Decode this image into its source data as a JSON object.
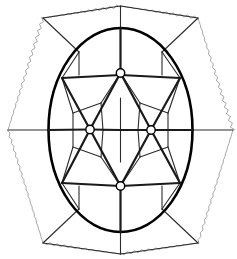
{
  "figure": {
    "type": "line-diagram",
    "canvas": {
      "width": 237,
      "height": 259,
      "background": "#ffffff"
    },
    "colors": {
      "ellipse_stroke": "#000000",
      "heavy_edge": "#1a1a1a",
      "light_edge": "#2b2b2b",
      "wavy_border": "#a8a8a8",
      "node_fill": "#ffffff",
      "node_stroke": "#000000"
    },
    "stroke_widths": {
      "ellipse": 2.6,
      "heavy_edge": 2.2,
      "light_edge": 1.1,
      "wavy_border": 1.0,
      "node": 1.4
    },
    "ellipse": {
      "label": "outer-ellipse",
      "cx": 120.5,
      "cy": 130,
      "rx": 72,
      "ry": 102
    },
    "wavy_border": {
      "label": "wavy-hexagon-border",
      "amplitude": 1.6,
      "wavelength": 7,
      "vertices": [
        [
          120.5,
          6
        ],
        [
          198,
          18
        ],
        [
          233,
          130
        ],
        [
          198,
          243
        ],
        [
          120.5,
          254
        ],
        [
          43,
          243
        ],
        [
          8,
          130
        ],
        [
          43,
          18
        ]
      ]
    },
    "nodes": [
      {
        "name": "node-top-center",
        "x": 120.5,
        "y": 73,
        "r": 4.2
      },
      {
        "name": "node-mid-left",
        "x": 90,
        "y": 129.5,
        "r": 4.2
      },
      {
        "name": "node-mid-right",
        "x": 151,
        "y": 130,
        "r": 4.2
      },
      {
        "name": "node-bottom-center",
        "x": 120.5,
        "y": 186,
        "r": 4.2
      }
    ],
    "heavy_edges": [
      {
        "name": "edge-vertical-axis-top",
        "x1": 120.5,
        "y1": 28,
        "x2": 120.5,
        "y2": 73
      },
      {
        "name": "edge-vertical-axis-bottom",
        "x1": 120.5,
        "y1": 186,
        "x2": 120.5,
        "y2": 232
      },
      {
        "name": "edge-horiz-left-band",
        "x1": 62,
        "y1": 78,
        "x2": 120.5,
        "y2": 75
      },
      {
        "name": "edge-horiz-right-band",
        "x1": 120.5,
        "y1": 75,
        "x2": 180,
        "y2": 78
      },
      {
        "name": "edge-horiz-left-band-low",
        "x1": 62,
        "y1": 183,
        "x2": 120.5,
        "y2": 186
      },
      {
        "name": "edge-horiz-right-band-low",
        "x1": 120.5,
        "y1": 186,
        "x2": 180,
        "y2": 183
      },
      {
        "name": "edge-top-to-midleft",
        "x1": 120.5,
        "y1": 73,
        "x2": 90,
        "y2": 129.5
      },
      {
        "name": "edge-top-to-midright",
        "x1": 120.5,
        "y1": 73,
        "x2": 151,
        "y2": 130
      },
      {
        "name": "edge-midleft-to-bottom",
        "x1": 90,
        "y1": 129.5,
        "x2": 120.5,
        "y2": 186
      },
      {
        "name": "edge-midright-to-bottom",
        "x1": 151,
        "y1": 130,
        "x2": 120.5,
        "y2": 186
      },
      {
        "name": "edge-midleft-to-upperleft-rim",
        "x1": 90,
        "y1": 129.5,
        "x2": 62,
        "y2": 78
      },
      {
        "name": "edge-midright-to-upperright-rim",
        "x1": 151,
        "y1": 130,
        "x2": 180,
        "y2": 78
      },
      {
        "name": "edge-midleft-to-lowerleft-rim",
        "x1": 90,
        "y1": 129.5,
        "x2": 62,
        "y2": 183
      },
      {
        "name": "edge-midright-to-lowerright-rim",
        "x1": 151,
        "y1": 130,
        "x2": 180,
        "y2": 183
      },
      {
        "name": "edge-midleft-to-center-horiz",
        "x1": 90,
        "y1": 129.5,
        "x2": 120.5,
        "y2": 130
      },
      {
        "name": "edge-center-to-midright-horiz",
        "x1": 120.5,
        "y1": 130,
        "x2": 151,
        "y2": 130
      },
      {
        "name": "edge-left-rim-horizontal",
        "x1": 48,
        "y1": 130,
        "x2": 90,
        "y2": 129.5
      },
      {
        "name": "edge-right-rim-horizontal",
        "x1": 151,
        "y1": 130,
        "x2": 193,
        "y2": 130
      }
    ],
    "light_edges": [
      {
        "name": "inner-cell-top-left",
        "x1": 120.5,
        "y1": 73,
        "x2": 101,
        "y2": 103
      },
      {
        "name": "inner-cell-top-right",
        "x1": 120.5,
        "y1": 73,
        "x2": 140,
        "y2": 103
      },
      {
        "name": "inner-cell-left-down",
        "x1": 101,
        "y1": 103,
        "x2": 103,
        "y2": 130
      },
      {
        "name": "inner-cell-right-down",
        "x1": 140,
        "y1": 103,
        "x2": 138,
        "y2": 130
      },
      {
        "name": "inner-cell-left-join",
        "x1": 103,
        "y1": 130,
        "x2": 120.5,
        "y2": 130
      },
      {
        "name": "inner-cell-right-join",
        "x1": 120.5,
        "y1": 130,
        "x2": 138,
        "y2": 130
      },
      {
        "name": "inner-cell-bottom-left",
        "x1": 103,
        "y1": 130,
        "x2": 101,
        "y2": 157
      },
      {
        "name": "inner-cell-bottom-right",
        "x1": 138,
        "y1": 130,
        "x2": 140,
        "y2": 157
      },
      {
        "name": "inner-cell-bottom-left-join",
        "x1": 101,
        "y1": 157,
        "x2": 120.5,
        "y2": 186
      },
      {
        "name": "inner-cell-bottom-right-join",
        "x1": 140,
        "y1": 157,
        "x2": 120.5,
        "y2": 186
      },
      {
        "name": "inner-vertical-upper",
        "x1": 120.5,
        "y1": 98,
        "x2": 120.5,
        "y2": 130
      },
      {
        "name": "inner-vertical-lower",
        "x1": 120.5,
        "y1": 130,
        "x2": 120.5,
        "y2": 162
      },
      {
        "name": "petal-upper-left-out",
        "x1": 101,
        "y1": 103,
        "x2": 73,
        "y2": 113
      },
      {
        "name": "petal-upper-right-out",
        "x1": 140,
        "y1": 103,
        "x2": 168,
        "y2": 113
      },
      {
        "name": "petal-lower-left-out",
        "x1": 101,
        "y1": 157,
        "x2": 73,
        "y2": 147
      },
      {
        "name": "petal-lower-right-out",
        "x1": 140,
        "y1": 157,
        "x2": 168,
        "y2": 147
      },
      {
        "name": "petal-upper-left-rim",
        "x1": 73,
        "y1": 113,
        "x2": 62,
        "y2": 78
      },
      {
        "name": "petal-upper-right-rim",
        "x1": 168,
        "y1": 113,
        "x2": 180,
        "y2": 78
      },
      {
        "name": "petal-lower-left-rim",
        "x1": 73,
        "y1": 147,
        "x2": 62,
        "y2": 183
      },
      {
        "name": "petal-lower-right-rim",
        "x1": 168,
        "y1": 147,
        "x2": 180,
        "y2": 183
      },
      {
        "name": "petal-left-vert",
        "x1": 73,
        "y1": 113,
        "x2": 73,
        "y2": 147
      },
      {
        "name": "petal-right-vert",
        "x1": 168,
        "y1": 113,
        "x2": 168,
        "y2": 147
      },
      {
        "name": "rim-upper-left-arc-chord",
        "x1": 62,
        "y1": 78,
        "x2": 79,
        "y2": 52
      },
      {
        "name": "rim-upper-right-arc-chord",
        "x1": 180,
        "y1": 78,
        "x2": 162,
        "y2": 52
      },
      {
        "name": "rim-lower-left-arc-chord",
        "x1": 62,
        "y1": 183,
        "x2": 79,
        "y2": 209
      },
      {
        "name": "rim-lower-right-arc-chord",
        "x1": 180,
        "y1": 183,
        "x2": 162,
        "y2": 209
      },
      {
        "name": "cap-top-left-vert",
        "x1": 79,
        "y1": 52,
        "x2": 79,
        "y2": 75
      },
      {
        "name": "cap-top-right-vert",
        "x1": 162,
        "y1": 52,
        "x2": 162,
        "y2": 75
      },
      {
        "name": "cap-bottom-left-vert",
        "x1": 79,
        "y1": 209,
        "x2": 79,
        "y2": 186
      },
      {
        "name": "cap-bottom-right-vert",
        "x1": 162,
        "y1": 209,
        "x2": 162,
        "y2": 186
      }
    ],
    "radial_spokes": [
      {
        "name": "spoke-top-left",
        "x1": 79,
        "y1": 52,
        "x2": 43,
        "y2": 18
      },
      {
        "name": "spoke-top-right",
        "x1": 162,
        "y1": 52,
        "x2": 198,
        "y2": 18
      },
      {
        "name": "spoke-top-center",
        "x1": 120.5,
        "y1": 28,
        "x2": 120.5,
        "y2": 6
      },
      {
        "name": "spoke-bottom-left",
        "x1": 79,
        "y1": 209,
        "x2": 43,
        "y2": 243
      },
      {
        "name": "spoke-bottom-right",
        "x1": 162,
        "y1": 209,
        "x2": 198,
        "y2": 243
      },
      {
        "name": "spoke-bottom-center",
        "x1": 120.5,
        "y1": 232,
        "x2": 120.5,
        "y2": 254
      },
      {
        "name": "spoke-left",
        "x1": 48,
        "y1": 130,
        "x2": 8,
        "y2": 130
      },
      {
        "name": "spoke-right",
        "x1": 193,
        "y1": 130,
        "x2": 233,
        "y2": 130
      }
    ],
    "outer_chords": [
      {
        "name": "outer-chord-top-left",
        "x1": 43,
        "y1": 18,
        "x2": 120.5,
        "y2": 6
      },
      {
        "name": "outer-chord-top-right",
        "x1": 120.5,
        "y1": 6,
        "x2": 198,
        "y2": 18
      },
      {
        "name": "outer-chord-bottom-left",
        "x1": 43,
        "y1": 243,
        "x2": 120.5,
        "y2": 254
      },
      {
        "name": "outer-chord-bottom-right",
        "x1": 120.5,
        "y1": 254,
        "x2": 198,
        "y2": 243
      }
    ]
  }
}
